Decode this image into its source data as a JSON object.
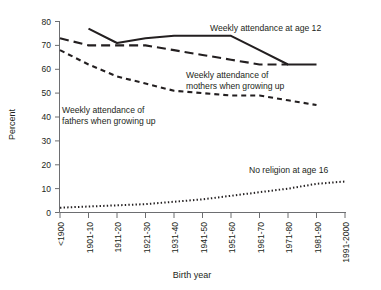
{
  "chart_data": {
    "type": "line",
    "title": "",
    "xlabel": "Birth year",
    "ylabel": "Percent",
    "ylim": [
      0,
      80
    ],
    "ytick_step": 10,
    "yticks": [
      "0",
      "10",
      "20",
      "30",
      "40",
      "50",
      "60",
      "70",
      "80"
    ],
    "grid": false,
    "legend": "inline-annotations",
    "categories": [
      "<1900",
      "1901-10",
      "1911-20",
      "1921-30",
      "1931-40",
      "1941-50",
      "1951-60",
      "1961-70",
      "1971-80",
      "1981-90",
      "1991-2000"
    ],
    "series": [
      {
        "name": "Weekly attendance at age 12",
        "style": "solid",
        "values": [
          null,
          77,
          71,
          73,
          74,
          74,
          74,
          68,
          62,
          62,
          null
        ]
      },
      {
        "name": "Weekly attendance of mothers when growing up",
        "style": "long-dash",
        "values": [
          73,
          70,
          70,
          70,
          68,
          66,
          64,
          62,
          62,
          null,
          null
        ]
      },
      {
        "name": "Weekly attendance of fathers when growing up",
        "style": "short-dash",
        "values": [
          68,
          62,
          57,
          54,
          51,
          50,
          49,
          49,
          47,
          45,
          null
        ]
      },
      {
        "name": "No religion at age 16",
        "style": "dotted",
        "values": [
          2,
          2.5,
          3,
          3.5,
          4.5,
          5.5,
          7,
          8.5,
          10,
          12,
          13
        ]
      }
    ],
    "annotations": [
      {
        "id": "ann-age12",
        "text": "Weekly attendance at age 12"
      },
      {
        "id": "ann-mothers-l1",
        "text": "Weekly attendance of"
      },
      {
        "id": "ann-mothers-l2",
        "text": "mothers when growing up"
      },
      {
        "id": "ann-fathers-l1",
        "text": "Weekly attendance of"
      },
      {
        "id": "ann-fathers-l2",
        "text": "fathers when growing up"
      },
      {
        "id": "ann-noreligion",
        "text": "No religion at age 16"
      }
    ]
  },
  "colors": {
    "ink": "#231f20",
    "axis": "#6d6e71",
    "background": "#ffffff"
  }
}
